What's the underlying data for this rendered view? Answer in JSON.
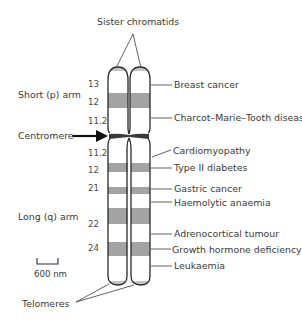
{
  "figure": {
    "title": "Sister chromatids",
    "arm_labels": {
      "short": "Short (p) arm",
      "centromere": "Centromere",
      "long": "Long (q) arm",
      "telomeres": "Telomeres"
    },
    "scale_bar": {
      "label": "600 nm"
    },
    "band_labels": [
      {
        "label": "13",
        "y": 85
      },
      {
        "label": "12",
        "y": 103
      },
      {
        "label": "11.2",
        "y": 122
      },
      {
        "label": "11.2",
        "y": 154
      },
      {
        "label": "12",
        "y": 171
      },
      {
        "label": "21",
        "y": 189
      },
      {
        "label": "22",
        "y": 225
      },
      {
        "label": "24",
        "y": 249
      }
    ],
    "diseases": [
      {
        "label": "Breast cancer",
        "y": 85
      },
      {
        "label": "Charcot–Marie–Tooth disease",
        "y": 118
      },
      {
        "label": "Cardiomyopathy",
        "y": 152
      },
      {
        "label": "Type II diabetes",
        "y": 168
      },
      {
        "label": "Gastric cancer",
        "y": 189
      },
      {
        "label": "Haemolytic anaemia",
        "y": 203
      },
      {
        "label": "Adrenocortical tumour",
        "y": 234
      },
      {
        "label": "Growth hormone deficiency",
        "y": 250
      },
      {
        "label": "Leukaemia",
        "y": 266
      }
    ],
    "colors": {
      "outline": "#2a2a2a",
      "band": "#a3a3a3",
      "centromere": "#3a3a3a",
      "text": "#3a3a3a"
    }
  }
}
